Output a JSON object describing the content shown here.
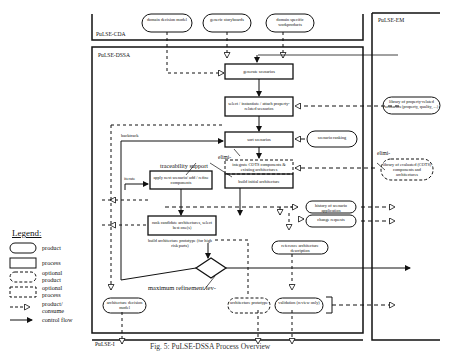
{
  "regions": {
    "cda": "PuLSE-CDA",
    "dssa": "PuLSE-DSSA",
    "em": "PuLSE-EM",
    "i": "PuLSE-I"
  },
  "inputs": {
    "domain_decision_model": "domain decision model",
    "generic_storyboards": "generic storyboards",
    "domain_specific_workproducts": "domain specific workproducts"
  },
  "processes": {
    "generate_scenarios": "generate scenarios",
    "select_instantiate": "select / instantiate / attach property-related scenarios",
    "sort_scenarios": "sort scenarios",
    "integrate_cots": "integrate COTS components & existing architectures",
    "build_initial": "build initial architecture",
    "apply_next": "apply next scenario/ add / refine components",
    "rank_candidate": "rank candidate architectures, select best one(s)",
    "build_prototype": "build architecture prototype (for high risk parts)"
  },
  "products": {
    "library_property": "library of property-related scenarios (property, quality, ...)",
    "scenario_ranking": "scenario ranking",
    "library_cots": "library of evaluated (COTS) components and architectures",
    "history_scenario": "history of scenario application",
    "change_requests": "change requests",
    "reference_architecture": "reference architecture description",
    "architecture_decision_model": "architecture decision model",
    "architecture_prototype": "architecture prototype",
    "validation": "validation (review only)"
  },
  "annotations": {
    "backtrack": "backtrack",
    "iterate": "iterate",
    "traceability": "traceability support",
    "elimi1": "elimi-",
    "elimi2": "elimi-",
    "max_refinement": "maximum refinement lev-"
  },
  "legend": {
    "title": "Legend:",
    "items": [
      {
        "shape": "product",
        "label": "product"
      },
      {
        "shape": "process",
        "label": "process"
      },
      {
        "shape": "optional-product",
        "label": "optional product"
      },
      {
        "shape": "optional-process",
        "label": "optional process"
      },
      {
        "shape": "produce-consume",
        "label": "product/ consume"
      },
      {
        "shape": "control-flow",
        "label": "control flow"
      }
    ]
  },
  "caption": "Fig. 5: PuLSE-DSSA Process Overview"
}
